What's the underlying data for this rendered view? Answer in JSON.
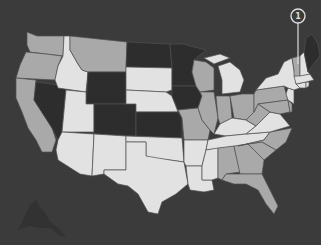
{
  "map": {
    "type": "choropleth",
    "region": "United States",
    "background_color": "#3b3b3b",
    "colors": {
      "dark": "#2d2d2d",
      "mid": "#a9a9a9",
      "light": "#e2e2e2"
    },
    "states": {
      "WA": "mid",
      "OR": "mid",
      "CA": "mid",
      "NV": "dark",
      "ID": "light",
      "MT": "mid",
      "WY": "dark",
      "UT": "light",
      "CO": "dark",
      "AZ": "light",
      "NM": "light",
      "ND": "dark",
      "SD": "light",
      "NE": "light",
      "KS": "dark",
      "OK": "light",
      "TX": "light",
      "MN": "dark",
      "IA": "dark",
      "MO": "mid",
      "AR": "light",
      "LA": "light",
      "WI": "mid",
      "IL": "mid",
      "MI": "light",
      "IN": "mid",
      "OH": "mid",
      "KY": "light",
      "TN": "light",
      "MS": "light",
      "AL": "mid",
      "GA": "mid",
      "FL": "mid",
      "SC": "mid",
      "NC": "mid",
      "VA": "light",
      "WV": "mid",
      "PA": "mid",
      "NY": "light",
      "NJ": "light",
      "DE": "mid",
      "MD": "mid",
      "CT": "light",
      "RI": "light",
      "MA": "light",
      "VT": "mid",
      "NH": "light",
      "ME": "dark",
      "AK": "dark",
      "HI": "dark"
    },
    "callouts": [
      {
        "label": "1",
        "target": "NH"
      }
    ]
  }
}
